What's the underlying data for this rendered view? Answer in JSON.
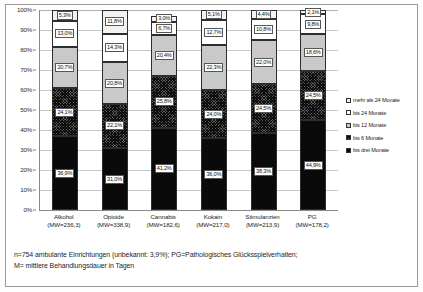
{
  "chart_data": {
    "type": "bar",
    "title": "",
    "subtitle": "",
    "xlabel": "",
    "ylabel": "",
    "ylim": [
      0,
      100
    ],
    "stacked": true,
    "stack_total": "100%",
    "grid": true,
    "legend_position": "right",
    "categories": [
      "Alkohol",
      "Opioide",
      "Cannabis",
      "Kokain",
      "Stimulanzien",
      "PG"
    ],
    "category_sublabels": [
      "(MW=236,3)",
      "(MW=338,9)",
      "(MW=182,6)",
      "(MW=217,0)",
      "(MW=213,9)",
      "(MW=178,2)"
    ],
    "y_ticks": [
      "0%",
      "10%",
      "20%",
      "30%",
      "40%",
      "50%",
      "60%",
      "70%",
      "80%",
      "90%",
      "100%"
    ],
    "series": [
      {
        "name": "bis drei Monate",
        "key": "s1",
        "values": [
          36.9,
          31.0,
          41.2,
          36.0,
          38.3,
          44.9
        ],
        "labels": [
          "36,9%",
          "31,0%",
          "41,2%",
          "36,0%",
          "38,3%",
          "44,9%"
        ]
      },
      {
        "name": "bis 6 Monate",
        "key": "s2",
        "values": [
          24.1,
          22.1,
          25.8,
          24.0,
          24.5,
          24.5
        ],
        "labels": [
          "24,1%",
          "22,1%",
          "25,8%",
          "24,0%",
          "24,5%",
          "24,5%"
        ]
      },
      {
        "name": "bis 12 Monate",
        "key": "s3",
        "values": [
          20.7,
          20.8,
          20.4,
          22.3,
          22.0,
          18.6
        ],
        "labels": [
          "20,7%",
          "20,8%",
          "20,4%",
          "22,3%",
          "22,0%",
          "18,6%"
        ]
      },
      {
        "name": "bis 24 Monate",
        "key": "s4",
        "values": [
          13.0,
          14.3,
          6.7,
          12.7,
          10.8,
          9.8
        ],
        "labels": [
          "13,0%",
          "14,3%",
          "6,7%",
          "12,7%",
          "10,8%",
          "9,8%"
        ]
      },
      {
        "name": "mehr als 24 Monate",
        "key": "s5",
        "values": [
          5.3,
          11.8,
          3.0,
          5.1,
          4.4,
          2.1
        ],
        "labels": [
          "5,3%",
          "11,8%",
          "3,0%",
          "5,1%",
          "4,4%",
          "2,1%"
        ]
      }
    ]
  },
  "legend": {
    "items": [
      {
        "label": "mehr als 24 Monate",
        "key": "s5",
        "color": "#f2f2f2"
      },
      {
        "label": "bis 24 Monate",
        "key": "s4",
        "color": "#ffffff"
      },
      {
        "label": "bis 12 Monate",
        "key": "s3",
        "color": "#c9c9c9"
      },
      {
        "label": "bis 6 Monate",
        "key": "s2",
        "color": "#5d5d5d"
      },
      {
        "label": "bis drei Monate",
        "key": "s1",
        "color": "#0a0a0a"
      }
    ]
  },
  "footnote": {
    "line1": "n=754 ambulante Einrichtungen (unbekannt: 3,9%); PG=Pathologisches Glücksspielverhalten;",
    "line2": "M= mittlere Behandlungsdauer in Tagen"
  }
}
